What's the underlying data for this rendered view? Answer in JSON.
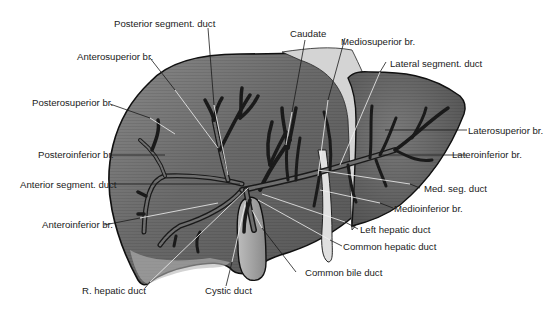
{
  "figure": {
    "colors": {
      "liver_fill": "#6f6f6f",
      "liver_shadow": "#4a4a4a",
      "liver_highlight": "#9a9a9a",
      "ligament_fill": "#d9d9d9",
      "duct_outline": "#1a1a1a",
      "gallbladder_fill": "#a8a8a8",
      "label_text": "#222222"
    }
  },
  "labels": {
    "posterior_segment_duct": "Posterior segment. duct",
    "anterosuperior_br": "Anterosuperior br.",
    "posterosuperior_br": "Posterosuperior br.",
    "posteroinferior_br": "Posteroinferior br.",
    "anterior_segment_duct": "Anterior segment. duct",
    "anteroinferior_br": "Anteroinferior br.",
    "r_hepatic_duct": "R. hepatic duct",
    "cystic_duct": "Cystic duct",
    "common_bile_duct": "Common bile duct",
    "common_hepatic_duct": "Common hepatic duct",
    "left_hepatic_duct": "Left hepatic duct",
    "medioinferior_br": "Medioinferior br.",
    "med_seg_duct": "Med. seg. duct",
    "lateroinferior_br": "Lateroinferior br.",
    "laterosuperior_br": "Laterosuperior br.",
    "lateral_segment_duct": "Lateral segment. duct",
    "mediosuperior_br": "Mediosuperior br.",
    "caudate": "Caudate"
  }
}
